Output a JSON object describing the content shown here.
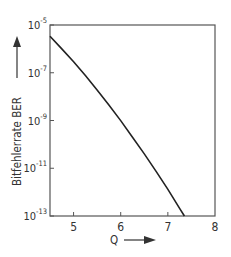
{
  "chart_data": {
    "type": "line",
    "title": "",
    "xlabel": "Q",
    "ylabel": "Bitfehlerrate BER",
    "xlim": [
      4.5,
      8
    ],
    "ylim_log10": [
      -13,
      -5
    ],
    "yscale": "log",
    "grid": false,
    "legend": null,
    "x_ticks": [
      "5",
      "6",
      "7",
      "8"
    ],
    "x_tick_values": [
      5,
      6,
      7,
      8
    ],
    "y_ticks": [
      {
        "base": "10",
        "exp": "-5",
        "value": -5
      },
      {
        "base": "10",
        "exp": "-7",
        "value": -7
      },
      {
        "base": "10",
        "exp": "-9",
        "value": -9
      },
      {
        "base": "10",
        "exp": "-11",
        "value": -11
      },
      {
        "base": "10",
        "exp": "-13",
        "value": -13
      }
    ],
    "series": [
      {
        "name": "BER(Q)",
        "x": [
          4.5,
          4.75,
          5.0,
          5.25,
          5.5,
          5.75,
          6.0,
          6.25,
          6.5,
          6.75,
          7.0,
          7.25,
          7.35
        ],
        "y": [
          3.4e-06,
          1e-06,
          2.9e-07,
          7.6e-08,
          1.9e-08,
          4.5e-09,
          9.9e-10,
          2e-10,
          4e-11,
          7.4e-12,
          1.3e-12,
          2.1e-13,
          1e-13
        ]
      }
    ]
  }
}
